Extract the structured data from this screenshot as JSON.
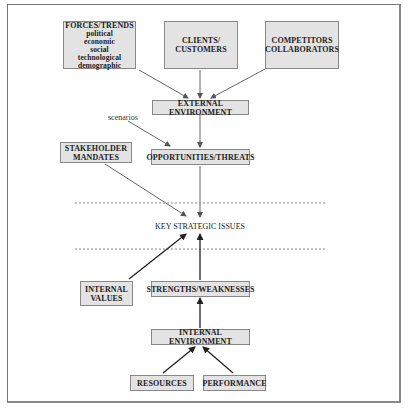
{
  "diagram": {
    "top_nodes": {
      "forces_trends": {
        "title": "FORCES/TRENDS",
        "items": [
          "political",
          "economic",
          "social",
          "technological",
          "demographic"
        ]
      },
      "clients_customers": {
        "line1": "CLIENTS/",
        "line2": "CUSTOMERS"
      },
      "competitors_collaborators": {
        "line1": "COMPETITORS",
        "line2": "COLLABORATORS"
      }
    },
    "external_environment": "EXTERNAL ENVIRONMENT",
    "scenarios_label": "scenarios",
    "stakeholder_mandates": {
      "line1": "STAKEHOLDER",
      "line2": "MANDATES"
    },
    "opportunities_threats": "OPPORTUNITIES/THREATS",
    "key_strategic_issues": "KEY STRATEGIC ISSUES",
    "internal_values": {
      "line1": "INTERNAL",
      "line2": "VALUES"
    },
    "strengths_weaknesses": "STRENGTHS/WEAKNESSES",
    "internal_environment": "INTERNAL ENVIRONMENT",
    "resources": "RESOURCES",
    "performance": "PERFORMANCE",
    "colors": {
      "box_fill": "#e3e3e3",
      "box_border": "#888888",
      "arrow": "#555555",
      "dashed": "#888888"
    }
  }
}
